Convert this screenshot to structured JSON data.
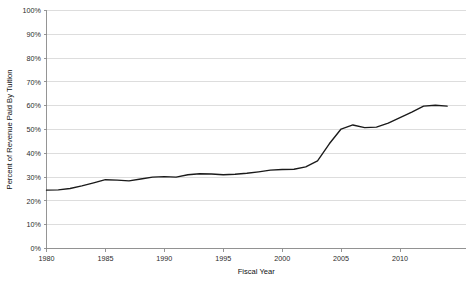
{
  "chart_data": {
    "type": "line",
    "title": "",
    "xlabel": "Fiscal Year",
    "ylabel": "Percent of Revenue Paid By Tuition",
    "xlim": [
      1980,
      2015.6
    ],
    "ylim": [
      0,
      100
    ],
    "grid": true,
    "legend": "none",
    "y_tick_labels": [
      "0%",
      "10%",
      "20%",
      "30%",
      "40%",
      "50%",
      "60%",
      "70%",
      "80%",
      "90%",
      "100%"
    ],
    "y_tick_values": [
      0,
      10,
      20,
      30,
      40,
      50,
      60,
      70,
      80,
      90,
      100
    ],
    "x_tick_labels": [
      "1980",
      "1985",
      "1990",
      "1995",
      "2000",
      "2005",
      "2010"
    ],
    "x_tick_values": [
      1980,
      1985,
      1990,
      1995,
      2000,
      2005,
      2010
    ],
    "series": [
      {
        "name": "Percent of Revenue Paid By Tuition",
        "color": "#1a1a1a",
        "x": [
          1980,
          1981,
          1982,
          1983,
          1984,
          1985,
          1986,
          1987,
          1988,
          1989,
          1990,
          1991,
          1992,
          1993,
          1994,
          1995,
          1996,
          1997,
          1998,
          1999,
          2000,
          2001,
          2002,
          2003,
          2004,
          2005,
          2006,
          2007,
          2008,
          2009,
          2010,
          2011,
          2012,
          2013,
          2014
        ],
        "values": [
          24.5,
          24.6,
          25.2,
          26.3,
          27.6,
          28.9,
          28.7,
          28.4,
          29.2,
          30.0,
          30.2,
          30.0,
          31.0,
          31.4,
          31.3,
          31.0,
          31.2,
          31.6,
          32.2,
          32.9,
          33.2,
          33.3,
          34.3,
          36.8,
          44.0,
          50.2,
          51.9,
          50.8,
          51.0,
          52.7,
          55.0,
          57.3,
          59.8,
          60.2,
          59.8
        ]
      }
    ]
  }
}
